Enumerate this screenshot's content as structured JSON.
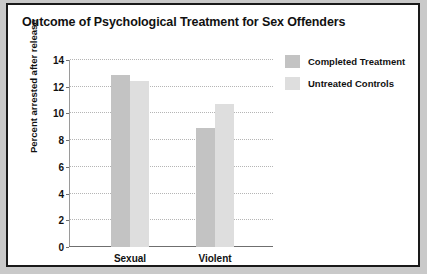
{
  "figure": {
    "title": "Outcome of Psychological Treatment for Sex Offenders",
    "frame_color": "#1a1a1a",
    "background": "#ffffff"
  },
  "legend": {
    "position": "right",
    "items": [
      {
        "label": "Completed Treatment",
        "color": "#c3c3c3",
        "swatch_name": "legend-swatch-completed"
      },
      {
        "label": "Untreated Controls",
        "color": "#dedede",
        "swatch_name": "legend-swatch-untreated"
      }
    ]
  },
  "chart_data": {
    "type": "bar",
    "title": "Outcome of Psychological Treatment for Sex Offenders",
    "xlabel": "",
    "ylabel": "Percent arrested after release",
    "categories": [
      "Sexual Offense",
      "Violent Offense"
    ],
    "category_lines": [
      [
        "Sexual",
        "Offense"
      ],
      [
        "Violent",
        "Offense"
      ]
    ],
    "series": [
      {
        "name": "Completed Treatment",
        "color": "#c3c3c3",
        "values": [
          12.9,
          8.9
        ]
      },
      {
        "name": "Untreated Controls",
        "color": "#dedede",
        "values": [
          12.4,
          10.7
        ]
      }
    ],
    "ylim": [
      0,
      14
    ],
    "ytick_step": 2,
    "yticks": [
      0,
      2,
      4,
      6,
      8,
      10,
      12,
      14
    ],
    "ytick_labels": [
      "0",
      "2",
      "4",
      "6",
      "8",
      "10",
      "12",
      "14"
    ],
    "grid": true,
    "grid_style": "dotted",
    "grid_color": "#b5b5b5",
    "legend_position": "right"
  }
}
